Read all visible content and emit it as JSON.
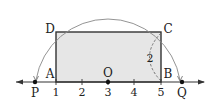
{
  "diagram": {
    "type": "number-line-geometry",
    "colors": {
      "rect_fill": "#e6e6e6",
      "rect_stroke": "#333333",
      "arc_stroke": "#777777",
      "axis": "#333333",
      "text": "#222222"
    },
    "number_line": {
      "ticks": [
        {
          "value": 1,
          "label": "1"
        },
        {
          "value": 2,
          "label": "2"
        },
        {
          "value": 3,
          "label": "3"
        },
        {
          "value": 4,
          "label": "4"
        },
        {
          "value": 5,
          "label": "5"
        }
      ]
    },
    "points": {
      "A": {
        "label": "A",
        "value": 1
      },
      "B": {
        "label": "B",
        "value": 5
      },
      "C": {
        "label": "C"
      },
      "D": {
        "label": "D"
      },
      "O": {
        "label": "O",
        "value": 3
      },
      "P": {
        "label": "P"
      },
      "Q": {
        "label": "Q"
      }
    },
    "measure": {
      "label": "2",
      "segment": "BC"
    }
  }
}
